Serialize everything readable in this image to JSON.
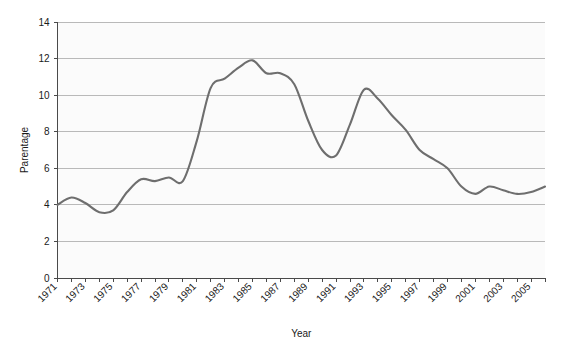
{
  "chart_data": {
    "type": "line",
    "title": "",
    "xlabel": "Year",
    "ylabel": "Parentage",
    "xlim": [
      1971,
      2006
    ],
    "ylim": [
      0,
      14
    ],
    "yticks": [
      0,
      2,
      4,
      6,
      8,
      10,
      12,
      14
    ],
    "xticks": [
      1971,
      1973,
      1975,
      1977,
      1979,
      1981,
      1983,
      1985,
      1987,
      1989,
      1991,
      1993,
      1995,
      1997,
      1999,
      2001,
      2003,
      2005
    ],
    "xtick_labels": [
      "1971",
      "1973",
      "1975",
      "1977",
      "1979",
      "1981",
      "1983",
      "1985",
      "1987",
      "1989",
      "1991",
      "1993",
      "1995",
      "1997",
      "1999",
      "2001",
      "2003",
      "2005"
    ],
    "ytick_labels": [
      "0",
      "2",
      "4",
      "6",
      "8",
      "10",
      "12",
      "14"
    ],
    "grid": true,
    "grid_axis": "y",
    "legend": null,
    "line_color": "#6e6e6e",
    "grid_color": "#b9b9b9",
    "plot_bg": "#fbfbfb",
    "x": [
      1971,
      1972,
      1973,
      1974,
      1975,
      1976,
      1977,
      1978,
      1979,
      1980,
      1981,
      1982,
      1983,
      1984,
      1985,
      1986,
      1987,
      1988,
      1989,
      1990,
      1991,
      1992,
      1993,
      1994,
      1995,
      1996,
      1997,
      1998,
      1999,
      2000,
      2001,
      2002,
      2003,
      2004,
      2005,
      2006
    ],
    "values": [
      4.0,
      4.4,
      4.1,
      3.6,
      3.7,
      4.7,
      5.4,
      5.3,
      5.5,
      5.3,
      7.5,
      10.4,
      10.9,
      11.5,
      11.9,
      11.2,
      11.2,
      10.6,
      8.6,
      7.0,
      6.7,
      8.4,
      10.3,
      9.8,
      8.9,
      8.1,
      7.0,
      6.5,
      6.0,
      5.0,
      4.6,
      5.0,
      4.8,
      4.6,
      4.7,
      5.0
    ],
    "series": [
      {
        "name": "Parentage",
        "values": [
          4.0,
          4.4,
          4.1,
          3.6,
          3.7,
          4.7,
          5.4,
          5.3,
          5.5,
          5.3,
          7.5,
          10.4,
          10.9,
          11.5,
          11.9,
          11.2,
          11.2,
          10.6,
          8.6,
          7.0,
          6.7,
          8.4,
          10.3,
          9.8,
          8.9,
          8.1,
          7.0,
          6.5,
          6.0,
          5.0,
          4.6,
          5.0,
          4.8,
          4.6,
          4.7,
          5.0
        ]
      }
    ]
  }
}
